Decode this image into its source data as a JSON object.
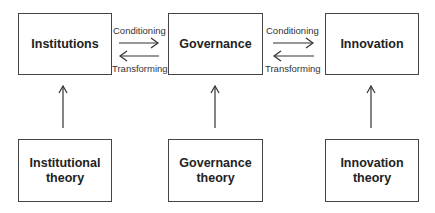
{
  "top_row": [
    {
      "label": "Institutions"
    },
    {
      "label": "Governance"
    },
    {
      "label": "Innovation"
    }
  ],
  "bottom_row": [
    {
      "line1": "Institutional",
      "line2": "theory"
    },
    {
      "line1": "Governance",
      "line2": "theory"
    },
    {
      "line1": "Innovation",
      "line2": "theory"
    }
  ],
  "links": [
    {
      "forward": "Conditioning",
      "backward": "Transforming"
    },
    {
      "forward": "Conditioning",
      "backward": "Transforming"
    }
  ]
}
